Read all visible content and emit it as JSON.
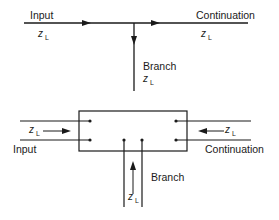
{
  "diagram": {
    "title": "",
    "top": {
      "input_label": "Input",
      "continuation_label": "Continuation",
      "branch_label": "Branch",
      "impedance": {
        "symbol": "z",
        "subscript": "L"
      }
    },
    "bottom": {
      "input_label": "Input",
      "continuation_label": "Continuation",
      "branch_label": "Branch",
      "impedance": {
        "symbol": "z",
        "subscript": "L"
      }
    },
    "colors": {
      "line": "#1a1a1a",
      "background": "#ffffff"
    }
  }
}
